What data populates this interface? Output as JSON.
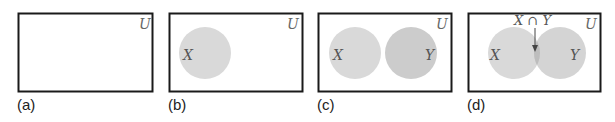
{
  "figure": {
    "universe_label": "U",
    "panels": [
      {
        "id": "a",
        "caption": "(a)",
        "sets": []
      },
      {
        "id": "b",
        "caption": "(b)",
        "sets": [
          "X"
        ]
      },
      {
        "id": "c",
        "caption": "(c)",
        "sets": [
          "X",
          "Y"
        ]
      },
      {
        "id": "d",
        "caption": "(d)",
        "sets": [
          "X",
          "Y"
        ],
        "annotation": "X ∩ Y"
      }
    ],
    "set_labels": {
      "x": "X",
      "y": "Y"
    },
    "colors": {
      "border": "#1a1a1a",
      "set_x_fill": "#d9d9d9",
      "set_y_fill": "#cccccc",
      "label_color": "#555555"
    }
  }
}
